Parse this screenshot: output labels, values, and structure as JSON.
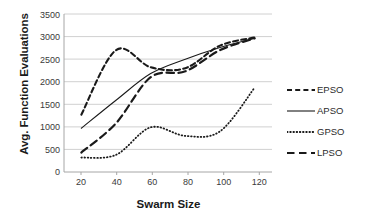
{
  "chart_data": {
    "type": "line",
    "title": "",
    "xlabel": "Swarm Size",
    "ylabel": "Avg. Function Evaluations",
    "x": [
      20,
      40,
      60,
      80,
      100,
      120
    ],
    "xlim": [
      10,
      130
    ],
    "ylim": [
      0,
      3500
    ],
    "xticks": [
      "20",
      "40",
      "60",
      "80",
      "100",
      "120"
    ],
    "yticks": [
      "0",
      "500",
      "1000",
      "1500",
      "2000",
      "2500",
      "3000",
      "3500"
    ],
    "grid": "horizontal",
    "legend_position": "right",
    "series": [
      {
        "name": "EPSO",
        "style": "dashed",
        "color": "#1a1a1a",
        "values": [
          1270,
          2700,
          2320,
          2300,
          2800,
          2980
        ]
      },
      {
        "name": "APSO",
        "style": "solid",
        "color": "#1a1a1a",
        "values": [
          970,
          1590,
          2180,
          2500,
          2760,
          2960
        ]
      },
      {
        "name": "GPSO",
        "style": "dotted",
        "color": "#1a1a1a",
        "values": [
          320,
          380,
          990,
          800,
          900,
          1870
        ]
      },
      {
        "name": "LPSO",
        "style": "long-dashed",
        "color": "#1a1a1a",
        "values": [
          430,
          1080,
          2100,
          2230,
          2700,
          2960
        ]
      }
    ]
  },
  "legend": {
    "items": [
      {
        "label": "EPSO",
        "style": "dashed"
      },
      {
        "label": "APSO",
        "style": "solid"
      },
      {
        "label": "GPSO",
        "style": "dotted"
      },
      {
        "label": "LPSO",
        "style": "long-dashed"
      }
    ]
  },
  "axes": {
    "x_title": "Swarm Size",
    "y_title": "Avg. Function Evaluations"
  },
  "colors": {
    "ink": "#1a1a1a",
    "grid": "#d0d0d0",
    "background": "#ffffff"
  }
}
